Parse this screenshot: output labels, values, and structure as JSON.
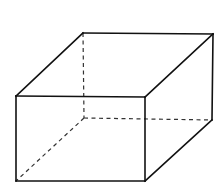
{
  "figure": {
    "shape": "rectangular-prism",
    "width": 217,
    "height": 183,
    "colors": {
      "background": "#ffffff",
      "edge": "#111111",
      "hidden_edge": "#333333"
    },
    "vertices": {
      "front_top_left": [
        16,
        96
      ],
      "front_top_right": [
        145,
        97
      ],
      "front_bottom_left": [
        16,
        181
      ],
      "front_bottom_right": [
        145,
        181
      ],
      "back_top_left": [
        83,
        33
      ],
      "back_top_right": [
        213,
        34
      ],
      "back_bottom_left": [
        84,
        118
      ],
      "back_bottom_right": [
        212,
        120
      ]
    },
    "visible_edges": [
      [
        "front_top_left",
        "front_top_right"
      ],
      [
        "front_top_right",
        "front_bottom_right"
      ],
      [
        "front_bottom_right",
        "front_bottom_left"
      ],
      [
        "front_bottom_left",
        "front_top_left"
      ],
      [
        "front_top_left",
        "back_top_left"
      ],
      [
        "back_top_left",
        "back_top_right"
      ],
      [
        "back_top_right",
        "front_top_right"
      ],
      [
        "back_top_right",
        "back_bottom_right"
      ],
      [
        "back_bottom_right",
        "front_bottom_right"
      ]
    ],
    "hidden_edges": [
      [
        "back_top_left",
        "back_bottom_left"
      ],
      [
        "back_bottom_left",
        "back_bottom_right"
      ],
      [
        "back_bottom_left",
        "front_bottom_left"
      ]
    ]
  }
}
